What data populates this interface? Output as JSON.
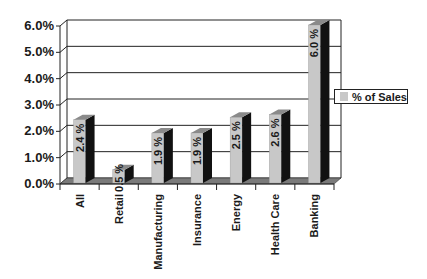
{
  "chart_data": {
    "type": "bar",
    "title": "",
    "xlabel": "",
    "ylabel": "",
    "categories": [
      "All",
      "Retail",
      "Manufacturing",
      "Insurance",
      "Energy",
      "Health Care",
      "Banking"
    ],
    "series": [
      {
        "name": "% of Sales",
        "values": [
          2.4,
          0.5,
          1.9,
          1.9,
          2.5,
          2.6,
          6.0
        ]
      }
    ],
    "data_labels": [
      "2.4 %",
      "0.5 %",
      "1.9 %",
      "1.9 %",
      "2.5 %",
      "2.6 %",
      "6.0 %"
    ],
    "ylim": [
      0,
      6
    ],
    "yticks": [
      "0.0%",
      "1.0%",
      "2.0%",
      "3.0%",
      "4.0%",
      "5.0%",
      "6.0%"
    ],
    "grid": true,
    "legend_position": "right",
    "style": "3d-column"
  },
  "legend": {
    "label": "% of Sales",
    "swatch_color": "#c8c8c8"
  },
  "colors": {
    "bar_front": "#c8c8c8",
    "bar_side": "#111111",
    "bar_top": "#8a8a8a",
    "floor": "#7a7a7a",
    "grid": "#222222"
  }
}
